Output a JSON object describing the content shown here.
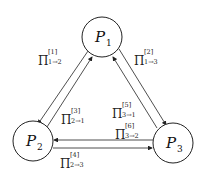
{
  "nodes": [
    {
      "id": "P1",
      "symbol": "P",
      "subscript": "1",
      "cx": 102,
      "cy": 37
    },
    {
      "id": "P2",
      "symbol": "P",
      "subscript": "2",
      "cx": 33,
      "cy": 141
    },
    {
      "id": "P3",
      "symbol": "P",
      "subscript": "3",
      "cx": 173,
      "cy": 143
    }
  ],
  "edges": [
    {
      "id": "e1",
      "symbol": "Π",
      "superscript": "[1]",
      "subscript": "1→2",
      "from": "P1",
      "to": "P2"
    },
    {
      "id": "e2",
      "symbol": "Π",
      "superscript": "[2]",
      "subscript": "1→3",
      "from": "P1",
      "to": "P3"
    },
    {
      "id": "e3",
      "symbol": "Π",
      "superscript": "[3]",
      "subscript": "2→1",
      "from": "P2",
      "to": "P1"
    },
    {
      "id": "e4",
      "symbol": "Π",
      "superscript": "[4]",
      "subscript": "2→3",
      "from": "P2",
      "to": "P3"
    },
    {
      "id": "e5",
      "symbol": "Π",
      "superscript": "[5]",
      "subscript": "3→1",
      "from": "P3",
      "to": "P1"
    },
    {
      "id": "e6",
      "symbol": "Π",
      "superscript": "[6]",
      "subscript": "3→2",
      "from": "P3",
      "to": "P2"
    }
  ]
}
